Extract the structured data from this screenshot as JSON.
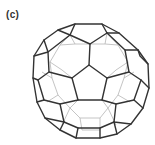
{
  "figure": {
    "panel_label": "(c)",
    "colors": {
      "front_edges": "#333333",
      "back_edges": "#b5b5b5",
      "background": "#ffffff"
    }
  }
}
